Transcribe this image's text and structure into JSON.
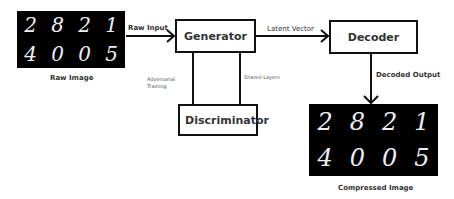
{
  "diagram": {
    "nodes": {
      "raw_image": {
        "label": "Raw Image",
        "digits": [
          "2",
          "8",
          "2",
          "1",
          "4",
          "0",
          "0",
          "5"
        ]
      },
      "generator": {
        "label": "Generator"
      },
      "discriminator": {
        "label": "Discriminator"
      },
      "decoder": {
        "label": "Decoder"
      },
      "compressed_image": {
        "label": "Compressed Image",
        "digits": [
          "2",
          "8",
          "2",
          "1",
          "4",
          "0",
          "0",
          "5"
        ]
      }
    },
    "edges": {
      "raw_input": {
        "label": "Raw Input"
      },
      "latent_vector": {
        "label": "Latent Vector"
      },
      "decoded_output": {
        "label": "Decoded Output"
      },
      "adversarial_training": {
        "label_line1": "Adversarial",
        "label_line2": "Training"
      },
      "shared_layers": {
        "label": "Shared Layers"
      }
    }
  }
}
